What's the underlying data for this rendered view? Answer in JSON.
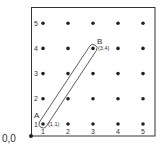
{
  "diagram": {
    "origin_label": "0,0",
    "x_ticks": [
      "1",
      "2",
      "3",
      "4",
      "5"
    ],
    "y_ticks": [
      "1",
      "2",
      "3",
      "4",
      "5"
    ],
    "grid": {
      "cols": 5,
      "rows": 5
    },
    "points": [
      {
        "label": "A",
        "coord": "(1,1)",
        "x": 1,
        "y": 1
      },
      {
        "label": "B",
        "coord": "(3,4)",
        "x": 3,
        "y": 4
      }
    ],
    "colors": {
      "ink": "#222222",
      "frame": "#333333",
      "background": "#ffffff"
    }
  }
}
